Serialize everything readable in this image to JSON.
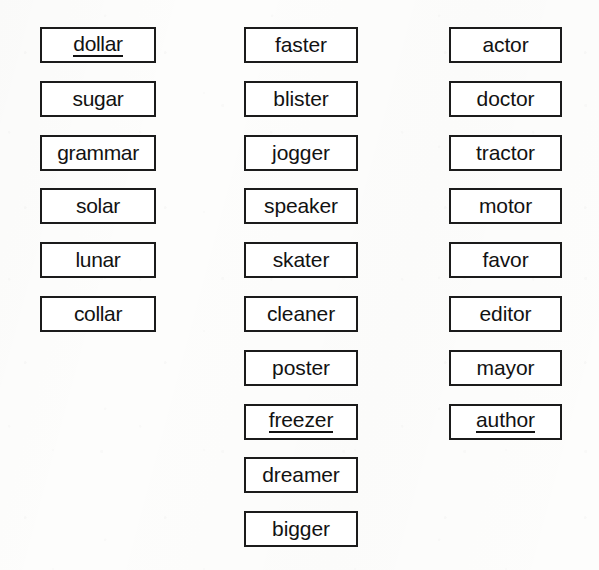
{
  "worksheet": {
    "title": "Word Box Worksheet",
    "background_color": "#fdfdfc",
    "box_border_color": "#1b1b1b",
    "box_fill_color": "#ffffff",
    "text_color": "#121212",
    "columns": [
      {
        "name": "column-1",
        "items": [
          {
            "word": "dollar",
            "underlined": true
          },
          {
            "word": "sugar",
            "underlined": false
          },
          {
            "word": "grammar",
            "underlined": false
          },
          {
            "word": "solar",
            "underlined": false
          },
          {
            "word": "lunar",
            "underlined": false
          },
          {
            "word": "collar",
            "underlined": false
          }
        ]
      },
      {
        "name": "column-2",
        "items": [
          {
            "word": "faster",
            "underlined": false
          },
          {
            "word": "blister",
            "underlined": false
          },
          {
            "word": "jogger",
            "underlined": false
          },
          {
            "word": "speaker",
            "underlined": false
          },
          {
            "word": "skater",
            "underlined": false
          },
          {
            "word": "cleaner",
            "underlined": false
          },
          {
            "word": "poster",
            "underlined": false
          },
          {
            "word": "freezer",
            "underlined": true
          },
          {
            "word": "dreamer",
            "underlined": false
          },
          {
            "word": "bigger",
            "underlined": false
          }
        ]
      },
      {
        "name": "column-3",
        "items": [
          {
            "word": "actor",
            "underlined": false
          },
          {
            "word": "doctor",
            "underlined": false
          },
          {
            "word": "tractor",
            "underlined": false
          },
          {
            "word": "motor",
            "underlined": false
          },
          {
            "word": "favor",
            "underlined": false
          },
          {
            "word": "editor",
            "underlined": false
          },
          {
            "word": "mayor",
            "underlined": false
          },
          {
            "word": "author",
            "underlined": true
          }
        ]
      }
    ]
  }
}
